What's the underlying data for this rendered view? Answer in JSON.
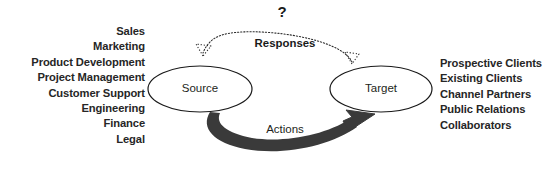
{
  "diagram": {
    "title_marker": "?",
    "nodes": [
      {
        "id": "source",
        "label": "Source"
      },
      {
        "id": "target",
        "label": "Target"
      }
    ],
    "edges": [
      {
        "id": "responses",
        "label": "Responses",
        "style": "dotted",
        "from": "target",
        "to": "source"
      },
      {
        "id": "actions",
        "label": "Actions",
        "style": "solid-thick",
        "from": "source",
        "to": "target"
      }
    ],
    "left_list": {
      "items": [
        "Sales",
        "Marketing",
        "Product Development",
        "Project Management",
        "Customer Support",
        "Engineering",
        "Finance",
        "Legal"
      ]
    },
    "right_list": {
      "items": [
        "Prospective Clients",
        "Existing Clients",
        "Channel Partners",
        "Public Relations",
        "Collaborators"
      ]
    },
    "colors": {
      "background": "#ffffff",
      "text": "#231f20",
      "stroke": "#1a1a1a",
      "actions_arrow": "#3a3a3a"
    }
  }
}
